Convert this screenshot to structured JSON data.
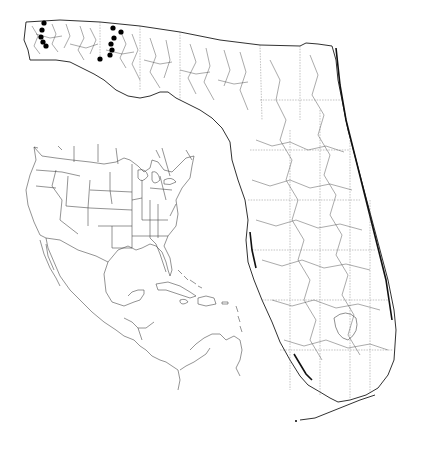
{
  "map": {
    "type": "distribution-map",
    "main_region": "Florida",
    "inset_region": "North America, Central America and Caribbean",
    "style": "black line art on white",
    "colors": {
      "background": "#ffffff",
      "lines": "#1a1a1a",
      "markers": "#000000"
    },
    "markers": {
      "symbol": "filled-circle",
      "clusters": [
        {
          "name": "western-panhandle-cluster",
          "points": [
            [
              44,
              23
            ],
            [
              42,
              30
            ],
            [
              41,
              37
            ],
            [
              43,
              42
            ],
            [
              46,
              46
            ]
          ]
        },
        {
          "name": "central-panhandle-cluster",
          "points": [
            [
              113,
              28
            ],
            [
              121,
              32
            ],
            [
              114,
              38
            ],
            [
              111,
              44
            ],
            [
              112,
              50
            ],
            [
              110,
              55
            ],
            [
              100,
              59
            ]
          ]
        }
      ]
    },
    "labels": []
  }
}
